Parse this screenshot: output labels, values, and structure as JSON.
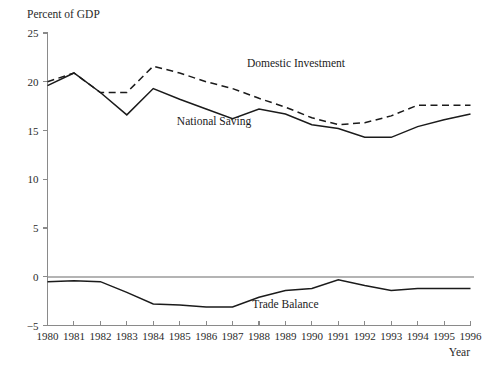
{
  "chart_data": {
    "type": "line",
    "title": "",
    "subtitle": "",
    "xlabel": "Year",
    "ylabel": "Percent of GDP",
    "ylabel_position": "top-left",
    "xlabel_position": "bottom-right",
    "grid": false,
    "legend": "inline-annotations",
    "xlim": [
      1980,
      1996
    ],
    "ylim": [
      -5,
      25
    ],
    "yticks": [
      -5,
      0,
      5,
      10,
      15,
      20,
      25
    ],
    "ytick_labels": [
      "−5",
      "0",
      "5",
      "10",
      "15",
      "20",
      "25"
    ],
    "zero_reference_line": 0,
    "x": [
      1980,
      1981,
      1982,
      1983,
      1984,
      1985,
      1986,
      1987,
      1988,
      1989,
      1990,
      1991,
      1992,
      1993,
      1994,
      1995,
      1996
    ],
    "categories": [
      "1980",
      "1981",
      "1982",
      "1983",
      "1984",
      "1985",
      "1986",
      "1987",
      "1988",
      "1989",
      "1990",
      "1991",
      "1992",
      "1993",
      "1994",
      "1995",
      "1996"
    ],
    "series": [
      {
        "name": "Domestic Investment",
        "style": "dashed",
        "color": "#1b1b1b",
        "values": [
          20.0,
          20.9,
          18.9,
          18.9,
          21.6,
          20.9,
          20.0,
          19.3,
          18.3,
          17.4,
          16.3,
          15.6,
          15.8,
          16.5,
          17.6,
          17.6,
          17.6
        ],
        "annotation": {
          "text": "Domestic Investment",
          "x": 1989.4,
          "y": 21.5
        }
      },
      {
        "name": "National Saving",
        "style": "solid",
        "color": "#1b1b1b",
        "values": [
          19.6,
          20.9,
          18.9,
          16.6,
          19.3,
          18.2,
          17.2,
          16.2,
          17.2,
          16.7,
          15.6,
          15.2,
          14.3,
          14.3,
          15.4,
          16.1,
          16.7
        ],
        "annotation": {
          "text": "National Saving",
          "x": 1986.3,
          "y": 15.6
        }
      },
      {
        "name": "Trade Balance",
        "style": "solid",
        "color": "#1b1b1b",
        "values": [
          -0.5,
          -0.4,
          -0.5,
          -1.6,
          -2.8,
          -2.9,
          -3.1,
          -3.1,
          -2.1,
          -1.4,
          -1.2,
          -0.3,
          -0.9,
          -1.4,
          -1.2,
          -1.2,
          -1.2
        ],
        "annotation": {
          "text": "Trade Balance",
          "x": 1989.0,
          "y": -3.2
        }
      }
    ]
  },
  "axes": {
    "y_caption": "Percent of GDP",
    "x_caption": "Year"
  }
}
